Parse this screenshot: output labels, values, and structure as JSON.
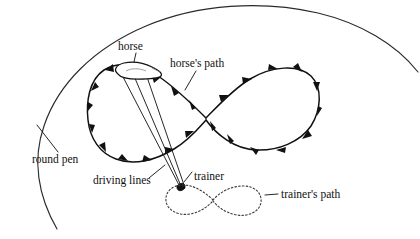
{
  "figure": {
    "background_color": "#ffffff",
    "ink_color": "#111111"
  },
  "labels": {
    "horse": "horse",
    "horses_path": "horse's path",
    "round_pen": "round pen",
    "driving_lines": "driving lines",
    "trainer": "trainer",
    "trainers_path": "trainer's path"
  },
  "elements": {
    "round_pen": {
      "name": "round pen",
      "style": "thin solid arc",
      "description": "Large arc representing the circular pen wall"
    },
    "horses_path": {
      "name": "horse's path",
      "style": "thick solid figure-eight with direction arrows",
      "arrow_count": 22,
      "description": "Large figure-eight loop traveled by the horse"
    },
    "trainers_path": {
      "name": "trainer's path",
      "style": "dotted small figure-eight",
      "description": "Small dotted figure-eight traveled by the trainer"
    },
    "driving_lines": {
      "name": "driving lines",
      "style": "two thin converging lines",
      "count": 2,
      "description": "Long reins from trainer to horse"
    },
    "horse": {
      "name": "horse",
      "style": "small white outlined body shape on the path"
    },
    "trainer": {
      "name": "trainer",
      "style": "small filled marker at the center of the trainer's path"
    }
  }
}
